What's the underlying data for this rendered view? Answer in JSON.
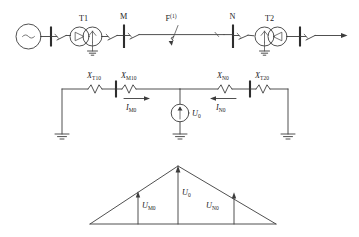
{
  "figure": {
    "colors": {
      "line": "#3c3c3c",
      "busbar": "#2e2e2e",
      "text": "#232323",
      "background": "#ffffff"
    }
  },
  "single_line": {
    "source_symbol": "~",
    "transformer_1": {
      "label": "T1",
      "left_winding": "delta",
      "right_winding": "wye-grounded"
    },
    "transformer_2": {
      "label": "T2",
      "left_winding": "wye-grounded",
      "right_winding": "delta"
    },
    "bus_m": "M",
    "bus_n": "N",
    "fault": {
      "label": "F",
      "superscript": "(1)",
      "type": "single-phase-to-ground"
    }
  },
  "zero_sequence_network": {
    "reactances": [
      {
        "symbol": "X",
        "subscript": "T10"
      },
      {
        "symbol": "X",
        "subscript": "M10"
      },
      {
        "symbol": "X",
        "subscript": "N0"
      },
      {
        "symbol": "X",
        "subscript": "T20"
      }
    ],
    "currents": [
      {
        "symbol": "I",
        "subscript": "M0",
        "direction": "right"
      },
      {
        "symbol": "I",
        "subscript": "N0",
        "direction": "left"
      }
    ],
    "source": {
      "symbol": "U",
      "subscript": "0"
    }
  },
  "voltage_distribution": {
    "peak": {
      "symbol": "U",
      "subscript": "0"
    },
    "left": {
      "symbol": "U",
      "subscript": "M0"
    },
    "right": {
      "symbol": "U",
      "subscript": "N0"
    }
  }
}
